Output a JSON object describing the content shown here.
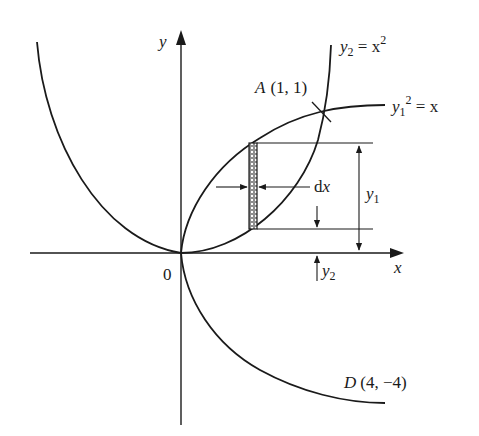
{
  "diagram": {
    "colors": {
      "stroke": "#1a1a1a",
      "background": "#ffffff"
    },
    "axes": {
      "x_label": "x",
      "y_label": "y",
      "origin_label": "0"
    },
    "curves": {
      "parabola_up": {
        "label_lhs": "y",
        "label_sub": "2",
        "label_eq": " = x",
        "label_sup": "2",
        "equation": "y2 = x^2"
      },
      "parabola_right": {
        "label_lhs": "y",
        "label_sub": "1",
        "label_sup": "2",
        "label_eq": " = x",
        "equation": "y1^2 = x"
      }
    },
    "points": {
      "A": {
        "name": "A",
        "coords": "(1, 1)"
      },
      "D": {
        "name": "D",
        "coords": "(4, −4)"
      }
    },
    "annotations": {
      "strip_width": {
        "label_d": "d",
        "label_x": "x"
      },
      "y1_height": {
        "label": "y",
        "sub": "1"
      },
      "y2_height": {
        "label": "y",
        "sub": "2"
      }
    }
  }
}
